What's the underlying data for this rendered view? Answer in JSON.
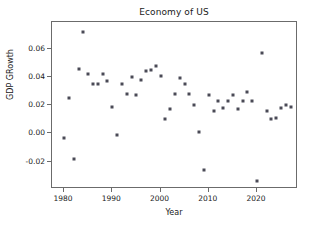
{
  "chart_data": {
    "type": "scatter",
    "title": "Economy of US",
    "xlabel": "Year",
    "ylabel": "GDP GRowth",
    "grid": false,
    "legend": null,
    "marker": "square",
    "marker_color": "#4a4a56",
    "xlim": [
      1977.5,
      2028.5
    ],
    "ylim": [
      -0.0395,
      0.079
    ],
    "xticks": [
      1980,
      1990,
      2000,
      2010,
      2020
    ],
    "xtick_labels": [
      "1980",
      "1990",
      "2000",
      "2010",
      "2020"
    ],
    "yticks": [
      -0.02,
      0.0,
      0.02,
      0.04,
      0.06
    ],
    "ytick_labels": [
      "-0.02",
      "0.00",
      "0.02",
      "0.04",
      "0.06"
    ],
    "x": [
      1980,
      1981,
      1982,
      1983,
      1984,
      1985,
      1986,
      1987,
      1988,
      1989,
      1990,
      1991,
      1992,
      1993,
      1994,
      1995,
      1996,
      1997,
      1998,
      1999,
      2000,
      2001,
      2002,
      2003,
      2004,
      2005,
      2006,
      2007,
      2008,
      2009,
      2010,
      2011,
      2012,
      2013,
      2014,
      2015,
      2016,
      2017,
      2018,
      2019,
      2020,
      2021,
      2022,
      2023,
      2024,
      2025,
      2026,
      2027
    ],
    "y": [
      -0.003,
      0.025,
      -0.018,
      0.046,
      0.072,
      0.042,
      0.035,
      0.035,
      0.042,
      0.037,
      0.019,
      -0.001,
      0.035,
      0.028,
      0.04,
      0.027,
      0.038,
      0.044,
      0.045,
      0.048,
      0.041,
      0.01,
      0.017,
      0.028,
      0.039,
      0.035,
      0.028,
      0.02,
      0.001,
      -0.026,
      0.027,
      0.016,
      0.023,
      0.018,
      0.023,
      0.027,
      0.017,
      0.023,
      0.029,
      0.023,
      -0.034,
      0.057,
      0.016,
      0.01,
      0.011,
      0.018,
      0.02,
      0.019
    ]
  }
}
